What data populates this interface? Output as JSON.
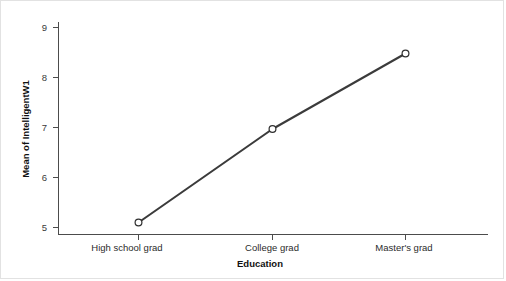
{
  "chart_data": {
    "type": "line",
    "title": "",
    "subtitle": "",
    "xlabel": "Education",
    "ylabel": "Mean of IntelligentW1",
    "categories": [
      "High school grad",
      "College grad",
      "Master's grad"
    ],
    "values": [
      5.1,
      6.97,
      8.48
    ],
    "series": [
      {
        "name": "Mean of IntelligentW1",
        "values": [
          5.1,
          6.97,
          8.48
        ]
      }
    ],
    "ylim": [
      4.8,
      9.2
    ],
    "yticks": [
      5,
      6,
      7,
      8,
      9
    ],
    "ytick_labels": [
      "5",
      "6",
      "7",
      "8",
      "9"
    ],
    "grid": false,
    "legend": "none",
    "marker": "open-circle",
    "line_color": "#3b3b3b",
    "marker_fill": "#ffffff",
    "marker_edge_color": "#2f2f2f",
    "background_color": "#ffffff",
    "axis_color": "#4c4c4c",
    "border_color": "#e2e2e2"
  },
  "axes": {
    "y": {
      "title": "Mean of IntelligentW1",
      "ticks": [
        {
          "label": "9",
          "value": 9
        },
        {
          "label": "8",
          "value": 8
        },
        {
          "label": "7",
          "value": 7
        },
        {
          "label": "6",
          "value": 6
        },
        {
          "label": "5",
          "value": 5
        }
      ]
    },
    "x": {
      "title": "Education",
      "ticks": [
        {
          "label": "High school grad"
        },
        {
          "label": "College grad"
        },
        {
          "label": "Master's grad"
        }
      ]
    }
  }
}
